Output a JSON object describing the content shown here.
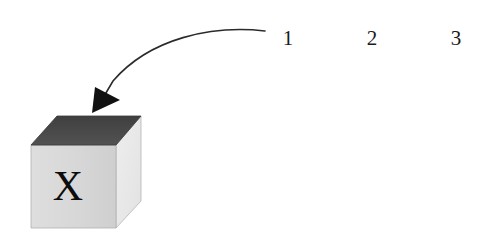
{
  "figure": {
    "background_color": "#ffffff",
    "cube": {
      "name": "labeled-cube",
      "face_letter": "X",
      "top_face_color": "#4a4a4a",
      "front_face_color": "#d9d9d9",
      "right_face_color": "#ececec",
      "outline_color": "#9a9a9a",
      "letter_color": "#0c0c0c"
    },
    "arrow": {
      "name": "curved-arrow",
      "stroke_color": "#2b2b2b",
      "head_color": "#111111",
      "start_x": 265,
      "start_y": 31,
      "tip_x": 92,
      "tip_y": 113,
      "direction": "down-left"
    },
    "numbers": [
      {
        "label": "1",
        "x": 288,
        "y": 40
      },
      {
        "label": "2",
        "x": 372,
        "y": 40
      },
      {
        "label": "3",
        "x": 456,
        "y": 40
      }
    ]
  }
}
